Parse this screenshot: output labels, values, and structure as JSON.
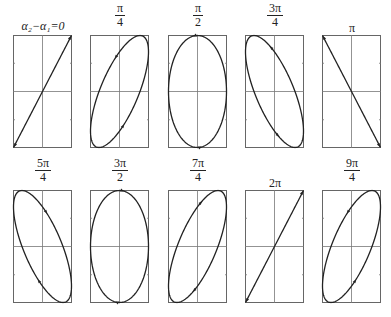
{
  "panels": [
    {
      "label_plain": "α₂−α₁=0",
      "num": "",
      "den": "",
      "kind": "line",
      "phase": 0,
      "dir": "up-right"
    },
    {
      "label_plain": "π/4",
      "num": "π",
      "den": "4",
      "kind": "ellipse",
      "phase": 0.7854
    },
    {
      "label_plain": "π/2",
      "num": "π",
      "den": "2",
      "kind": "ellipse",
      "phase": 1.5708
    },
    {
      "label_plain": "3π/4",
      "num": "3π",
      "den": "4",
      "kind": "ellipse",
      "phase": 2.3562
    },
    {
      "label_plain": "π",
      "num": "",
      "den": "",
      "kind": "line",
      "phase": 3.1416
    },
    {
      "label_plain": "5π/4",
      "num": "5π",
      "den": "4",
      "kind": "ellipse",
      "phase": 3.927
    },
    {
      "label_plain": "3π/2",
      "num": "3π",
      "den": "2",
      "kind": "ellipse",
      "phase": 4.7124
    },
    {
      "label_plain": "7π/4",
      "num": "7π",
      "den": "4",
      "kind": "ellipse",
      "phase": 5.4978
    },
    {
      "label_plain": "2π",
      "num": "",
      "den": "",
      "kind": "line",
      "phase": 6.2832
    },
    {
      "label_plain": "9π/4",
      "num": "9π",
      "den": "4",
      "kind": "ellipse",
      "phase": 7.0686
    }
  ],
  "labels": {
    "p0": "α₂−α₁=0",
    "p4": "π",
    "p8": "2π"
  },
  "colors": {
    "stroke": "#222222",
    "grid": "#777777",
    "frame": "#666666"
  }
}
